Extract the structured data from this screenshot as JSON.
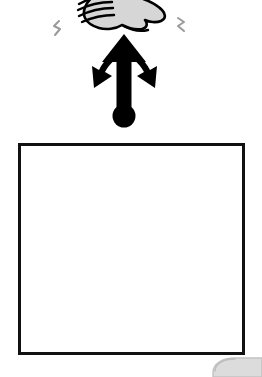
{
  "scene": {
    "title": "Hand gesture with multi-directional arrow above empty frame",
    "background_color": "#ffffff",
    "width": 262,
    "height": 377,
    "description": "Black and white clip-art style instructional illustration"
  },
  "hand": {
    "name": "hand-icon",
    "label": "Hand with curled fingers",
    "fill_color": "#d6d6d6",
    "outline_color": "#000000",
    "position": {
      "x": 78,
      "y": 0,
      "width": 88,
      "height": 32
    },
    "cut_off_edge": "top"
  },
  "sparkles": [
    {
      "name": "motion-spark-left",
      "label": "Motion spark left",
      "color": "#8a8a8a",
      "position": {
        "x": 52,
        "y": 22
      }
    },
    {
      "name": "motion-spark-right",
      "label": "Motion spark right",
      "color": "#8a8a8a",
      "position": {
        "x": 176,
        "y": 18
      }
    }
  ],
  "arrow": {
    "name": "multi-direction-arrow-icon",
    "label": "Trident arrow: up with two downward sweeping arms",
    "color": "#000000",
    "shaft": {
      "top_y": 35,
      "bottom_y": 112,
      "center_x": 124,
      "width": 15
    },
    "heads": [
      {
        "name": "arrowhead-up",
        "direction": "up",
        "tip_x": 124,
        "tip_y": 35
      },
      {
        "name": "arrowhead-down-left",
        "direction": "down-left",
        "tip_x": 95,
        "tip_y": 84
      },
      {
        "name": "arrowhead-down-right",
        "direction": "down-right",
        "tip_x": 156,
        "tip_y": 85
      }
    ],
    "pivot_dot": {
      "name": "arrow-pivot-dot",
      "cx": 124,
      "cy": 116,
      "r": 11,
      "color": "#000000"
    }
  },
  "frame": {
    "name": "content-frame",
    "label": "Empty rectangular frame",
    "border_color": "#111111",
    "border_width": 3,
    "fill_color": "#ffffff",
    "position": {
      "x": 18,
      "y": 143,
      "width": 227,
      "height": 212
    }
  },
  "grey_object": {
    "name": "grey-object-corner",
    "label": "Light grey rounded object at bottom-right, partially cropped",
    "fill_color": "#dcdcdc",
    "edge_color": "#bdbdbd",
    "position": {
      "x": 213,
      "y": 357,
      "width": 49,
      "height": 20
    },
    "cut_off_edge": "bottom-right"
  }
}
